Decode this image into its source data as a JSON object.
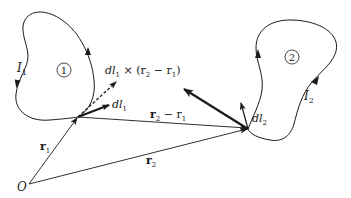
{
  "diagram": {
    "type": "biot-savart-two-current-loops",
    "colors": {
      "ink": "#1a1a1a",
      "background": "#ffffff"
    },
    "labels": {
      "loop1_current": "I",
      "loop1_current_sub": "1",
      "loop1_marker": "1",
      "loop2_current": "I",
      "loop2_current_sub": "2",
      "loop2_marker": "2",
      "dl1": "dl",
      "dl1_sub": "1",
      "dl2": "dl",
      "dl2_sub": "2",
      "cross_product_prefix": "dl",
      "cross_product_sub1": "1",
      "cross_product_mid": " × (r",
      "cross_product_sub2": "2",
      "cross_product_minus": " − r",
      "cross_product_sub3": "1",
      "cross_product_close": ")",
      "r1": "r",
      "r1_sub": "1",
      "r2": "r",
      "r2_sub": "2",
      "r2_minus_r1": "r",
      "r2_minus_r1_sub_a": "2",
      "r2_minus_r1_mid": " − r",
      "r2_minus_r1_sub_b": "1",
      "origin": "O"
    }
  }
}
